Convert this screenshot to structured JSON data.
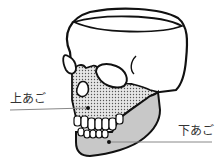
{
  "diagram": {
    "labels": {
      "upper_jaw": "上あご",
      "lower_jaw": "下あご"
    },
    "colors": {
      "outline": "#111111",
      "upper_jaw_fill": "dotted gray",
      "lower_jaw_fill": "#c8c8c8",
      "leader_line": "#888888"
    }
  }
}
